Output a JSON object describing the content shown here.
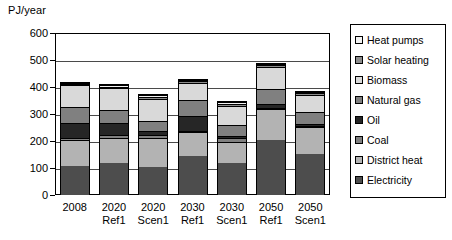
{
  "chart_data": {
    "type": "bar",
    "subtype": "stacked-vertical",
    "title": "",
    "xlabel": "",
    "ylabel": "PJ/year",
    "ylim": [
      0,
      600
    ],
    "ytick_values": [
      0,
      100,
      200,
      300,
      400,
      500,
      600
    ],
    "ytick_labels": [
      "0",
      "100",
      "200",
      "300",
      "400",
      "500",
      "600"
    ],
    "grid": "horizontal",
    "legend_position": "right",
    "categories": [
      {
        "line1": "2008",
        "line2": ""
      },
      {
        "line1": "2020",
        "line2": "Ref1"
      },
      {
        "line1": "2020",
        "line2": "Scen1"
      },
      {
        "line1": "2030",
        "line2": "Ref1"
      },
      {
        "line1": "2030",
        "line2": "Scen1"
      },
      {
        "line1": "2050",
        "line2": "Ref1"
      },
      {
        "line1": "2050",
        "line2": "Scen1"
      }
    ],
    "category_labels": [
      "2008",
      "2020 Ref1",
      "2020 Scen1",
      "2030 Ref1",
      "2030 Scen1",
      "2050 Ref1",
      "2050 Scen1"
    ],
    "stack_order_bottom_to_top": [
      "Electricity",
      "District heat",
      "Coal",
      "Oil",
      "Natural gas",
      "Biomass",
      "Solar heating",
      "Heat pumps"
    ],
    "series": [
      {
        "name": "Electricity",
        "color": "#4d4d4d",
        "values": [
          110,
          120,
          105,
          145,
          120,
          205,
          155
        ]
      },
      {
        "name": "District heat",
        "color": "#b3b3b3",
        "values": [
          95,
          95,
          110,
          90,
          80,
          115,
          100
        ]
      },
      {
        "name": "Coal",
        "color": "#808080",
        "values": [
          8,
          8,
          8,
          5,
          12,
          5,
          5
        ]
      },
      {
        "name": "Oil",
        "color": "#262626",
        "values": [
          55,
          45,
          15,
          55,
          8,
          15,
          5
        ]
      },
      {
        "name": "Natural gas",
        "color": "#808080",
        "values": [
          60,
          50,
          40,
          60,
          42,
          55,
          45
        ]
      },
      {
        "name": "Biomass",
        "color": "#d9d9d9",
        "values": [
          82,
          82,
          80,
          65,
          72,
          82,
          65
        ]
      },
      {
        "name": "Solar heating",
        "color": "#8c8c8c",
        "values": [
          5,
          5,
          8,
          5,
          8,
          8,
          5
        ]
      },
      {
        "name": "Heat pumps",
        "color": "#f2f2f2",
        "values": [
          5,
          5,
          9,
          5,
          8,
          5,
          5
        ]
      }
    ],
    "totals": [
      420,
      410,
      375,
      430,
      350,
      490,
      385
    ],
    "units": "PJ/year"
  },
  "legend": {
    "items": [
      {
        "label": "Heat pumps",
        "color": "#f2f2f2"
      },
      {
        "label": "Solar heating",
        "color": "#8c8c8c"
      },
      {
        "label": "Biomass",
        "color": "#d9d9d9"
      },
      {
        "label": "Natural gas",
        "color": "#808080"
      },
      {
        "label": "Oil",
        "color": "#262626"
      },
      {
        "label": "Coal",
        "color": "#808080"
      },
      {
        "label": "District heat",
        "color": "#b3b3b3"
      },
      {
        "label": "Electricity",
        "color": "#4d4d4d"
      }
    ]
  }
}
